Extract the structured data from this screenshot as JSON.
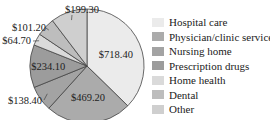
{
  "chart_data": {
    "type": "pie",
    "title": "",
    "start": "top",
    "direction": "clockwise",
    "slices": [
      {
        "name": "Hospital care",
        "value": 718.4,
        "label": "$718.40",
        "color": "#ebebeb",
        "label_pos": "inside"
      },
      {
        "name": "Physician/clinic services",
        "value": 469.2,
        "label": "$469.20",
        "color": "#ababab",
        "label_pos": "inside"
      },
      {
        "name": "Nursing home",
        "value": 138.4,
        "label": "$138.40",
        "color": "#a3a3a3",
        "label_pos": "outside"
      },
      {
        "name": "Prescription drugs",
        "value": 234.1,
        "label": "$234.10",
        "color": "#9c9c9c",
        "label_pos": "inside"
      },
      {
        "name": "Home health",
        "value": 64.7,
        "label": "$64.70",
        "color": "#dadada",
        "label_pos": "outside"
      },
      {
        "name": "Dental",
        "value": 101.2,
        "label": "$101.20",
        "color": "#bdbdbd",
        "label_pos": "outside"
      },
      {
        "name": "Other",
        "value": 199.3,
        "label": "$199.30",
        "color": "#cfcfcf",
        "label_pos": "outside"
      }
    ],
    "legend": [
      "Hospital care",
      "Physician/clinic services",
      "Nursing home",
      "Prescription drugs",
      "Home health",
      "Dental",
      "Other"
    ],
    "legend_position": "right"
  }
}
